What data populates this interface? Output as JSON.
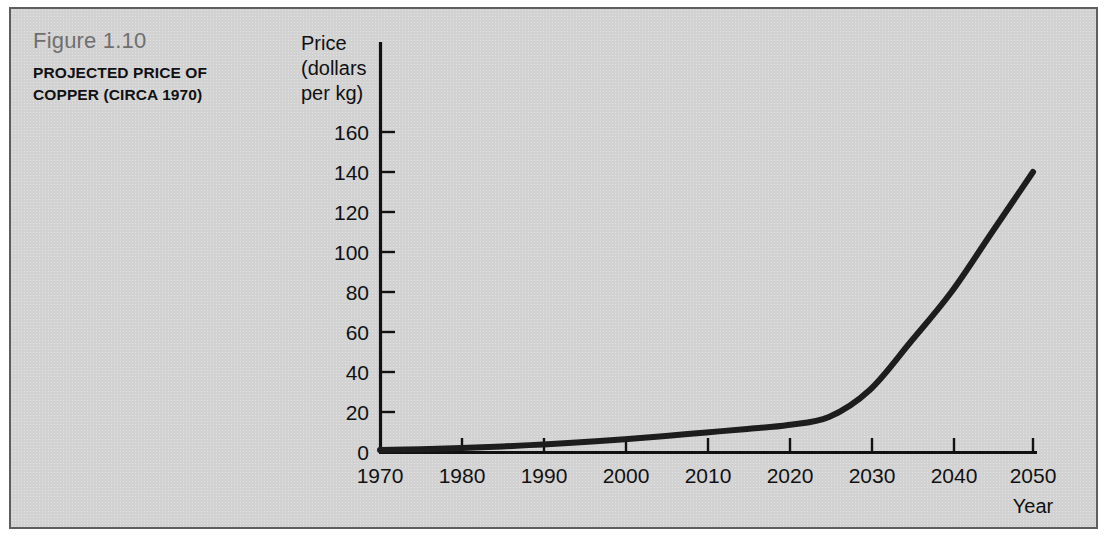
{
  "figure": {
    "number_label": "Figure 1.10",
    "title": "PROJECTED PRICE OF COPPER (CIRCA 1970)"
  },
  "colors": {
    "panel_background": "#d2d2d2",
    "panel_border": "#5e5e5e",
    "curve": "#1d1d1d",
    "axis": "#111111",
    "figure_number_text": "#6f6f6f",
    "title_text": "#111111",
    "page_background": "#ffffff"
  },
  "chart_data": {
    "type": "line",
    "title": "PROJECTED PRICE OF COPPER (CIRCA 1970)",
    "xlabel": "Year",
    "ylabel": "Price (dollars per kg)",
    "ylabel_lines": [
      "Price",
      "(dollars",
      "per kg)"
    ],
    "xlim": [
      1970,
      2050
    ],
    "ylim": [
      0,
      170
    ],
    "xticks": [
      1970,
      1980,
      1990,
      2000,
      2010,
      2020,
      2030,
      2040,
      2050
    ],
    "yticks": [
      0,
      20,
      40,
      60,
      80,
      100,
      120,
      140,
      160
    ],
    "xtick_labels": [
      "1970",
      "1980",
      "1990",
      "2000",
      "2010",
      "2020",
      "2030",
      "2040",
      "2050"
    ],
    "ytick_labels": [
      "0",
      "20",
      "40",
      "60",
      "80",
      "100",
      "120",
      "140",
      "160"
    ],
    "grid": false,
    "legend": false,
    "series": [
      {
        "name": "Projected price of copper",
        "x": [
          1970,
          1975,
          1980,
          1985,
          1990,
          1995,
          2000,
          2005,
          2010,
          2015,
          2020,
          2025,
          2030,
          2035,
          2040,
          2045,
          2050
        ],
        "values": [
          1.0,
          1.4,
          2.0,
          2.8,
          3.8,
          5.0,
          6.4,
          8.0,
          9.8,
          11.5,
          13.5,
          17.5,
          31.0,
          55.0,
          80.0,
          110.0,
          140.0
        ]
      }
    ]
  }
}
